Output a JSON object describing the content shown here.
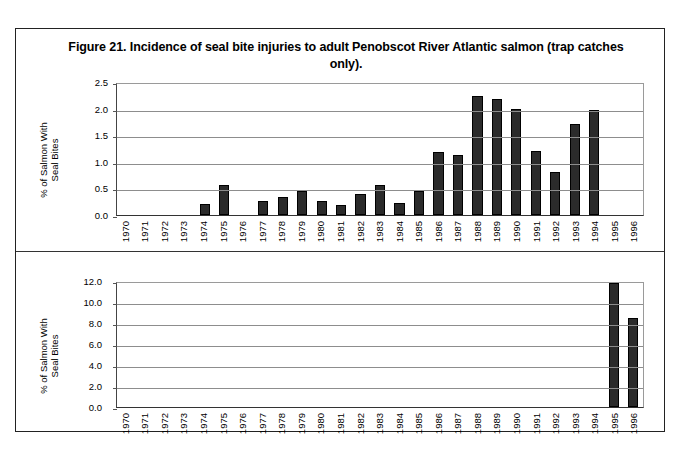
{
  "figure": {
    "title": "Figure 21. Incidence of seal bite injuries to adult Penobscot River Atlantic salmon (trap catches only)."
  },
  "chart_data": [
    {
      "type": "bar",
      "panel": "top",
      "title": "Figure 21. Incidence of seal bite injuries to adult Penobscot River Atlantic salmon (trap catches only).",
      "xlabel": "",
      "ylabel": "% of Salmon With Seal Bites",
      "ylim": [
        0.0,
        2.5
      ],
      "yticks": [
        "0.0",
        "0.5",
        "1.0",
        "1.5",
        "2.0",
        "2.5"
      ],
      "ytick_values": [
        0.0,
        0.5,
        1.0,
        1.5,
        2.0,
        2.5
      ],
      "grid": true,
      "legend": "none",
      "bar_color": "#2b2b2b",
      "categories": [
        "1970",
        "1971",
        "1972",
        "1973",
        "1974",
        "1975",
        "1976",
        "1977",
        "1978",
        "1979",
        "1980",
        "1981",
        "1982",
        "1983",
        "1984",
        "1985",
        "1986",
        "1987",
        "1988",
        "1989",
        "1990",
        "1991",
        "1992",
        "1993",
        "1994",
        "1995",
        "1996"
      ],
      "values": [
        0,
        0,
        0,
        0,
        0.21,
        0.56,
        0,
        0.27,
        0.33,
        0.45,
        0.27,
        0.18,
        0.4,
        0.57,
        0.23,
        0.45,
        1.18,
        1.13,
        2.23,
        2.19,
        1.99,
        1.21,
        0.8,
        1.71,
        1.98,
        0,
        0
      ]
    },
    {
      "type": "bar",
      "panel": "bottom",
      "title": "",
      "xlabel": "",
      "ylabel": "% of Salmon With Seal Bites",
      "ylim": [
        0.0,
        12.0
      ],
      "yticks": [
        "0.0",
        "2.0",
        "4.0",
        "6.0",
        "8.0",
        "10.0",
        "12.0"
      ],
      "ytick_values": [
        0.0,
        2.0,
        4.0,
        6.0,
        8.0,
        10.0,
        12.0
      ],
      "grid": true,
      "legend": "none",
      "bar_color": "#2b2b2b",
      "categories": [
        "1970",
        "1971",
        "1972",
        "1973",
        "1974",
        "1975",
        "1976",
        "1977",
        "1978",
        "1979",
        "1980",
        "1981",
        "1982",
        "1983",
        "1984",
        "1985",
        "1986",
        "1987",
        "1988",
        "1989",
        "1990",
        "1991",
        "1992",
        "1993",
        "1994",
        "1995",
        "1996"
      ],
      "values": [
        0,
        0,
        0,
        0,
        0,
        0,
        0,
        0,
        0,
        0,
        0,
        0,
        0,
        0,
        0,
        0,
        0,
        0,
        0,
        0,
        0,
        0,
        0,
        0,
        0,
        11.8,
        8.5
      ]
    }
  ]
}
